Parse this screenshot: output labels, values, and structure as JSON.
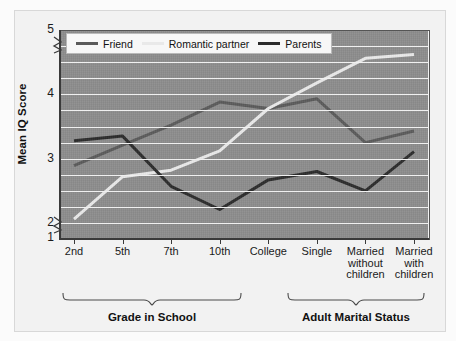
{
  "chart_data": {
    "type": "line",
    "title": "",
    "xlabel": "",
    "ylabel": "Mean IQ Score",
    "ylim": [
      1,
      5
    ],
    "yticks": [
      1,
      2,
      3,
      4,
      5
    ],
    "gridlines": [
      2.0,
      2.25,
      2.5,
      2.75,
      3.0,
      3.25,
      3.5,
      3.75,
      4.0,
      4.25,
      4.5,
      4.75
    ],
    "grid": true,
    "axis_break": "y-axis broken between 1 and 2",
    "legend_position": "top-left inside plot",
    "categories": [
      "2nd",
      "5th",
      "7th",
      "10th",
      "College",
      "Single",
      "Married without children",
      "Married with children"
    ],
    "group_labels": [
      {
        "label": "Grade in School",
        "categories": [
          "2nd",
          "5th",
          "7th",
          "10th",
          "College"
        ]
      },
      {
        "label": "Adult Marital Status",
        "categories": [
          "Single",
          "Married without children",
          "Married with children"
        ]
      }
    ],
    "series": [
      {
        "name": "Friend",
        "color": "#5a5a5a",
        "values": [
          2.89,
          3.21,
          3.52,
          3.88,
          3.78,
          3.93,
          3.25,
          3.43
        ]
      },
      {
        "name": "Romantic partner",
        "color": "#e9e9e9",
        "values": [
          2.06,
          2.72,
          2.82,
          3.12,
          3.78,
          4.18,
          4.56,
          4.62
        ]
      },
      {
        "name": "Parents",
        "color": "#2b2b2b",
        "values": [
          3.28,
          3.35,
          2.57,
          2.21,
          2.67,
          2.8,
          2.5,
          3.11
        ]
      }
    ]
  },
  "axis": {
    "y_title": "Mean IQ Score",
    "y_tick_labels": [
      "5",
      "4",
      "3",
      "2",
      "1"
    ],
    "x_tick_labels": [
      [
        "2nd"
      ],
      [
        "5th"
      ],
      [
        "7th"
      ],
      [
        "10th"
      ],
      [
        "College"
      ],
      [
        "Single"
      ],
      [
        "Married",
        "without",
        "children"
      ],
      [
        "Married",
        "with",
        "children"
      ]
    ]
  },
  "legend": {
    "items": [
      {
        "label": "Friend",
        "color": "#5a5a5a"
      },
      {
        "label": "Romantic partner",
        "color": "#e9e9e9"
      },
      {
        "label": "Parents",
        "color": "#2b2b2b"
      }
    ]
  },
  "groups": [
    {
      "label": "Grade in School"
    },
    {
      "label": "Adult Marital Status"
    }
  ],
  "colors": {
    "plot_background": "#8c8c8c",
    "panel_background": "#f2f2f2",
    "gridline": "#f0f0f0",
    "axis": "#3a3a3a",
    "text": "#111111"
  }
}
